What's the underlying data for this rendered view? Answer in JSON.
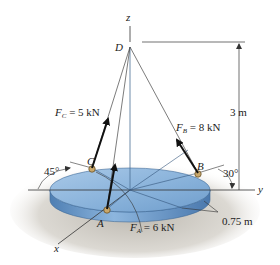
{
  "diagram": {
    "title": "",
    "axes": {
      "x": "x",
      "y": "y",
      "z": "z"
    },
    "points": {
      "D": "D",
      "A": "A",
      "B": "B",
      "C": "C"
    },
    "forces": [
      {
        "id": "FC",
        "symbol": "F",
        "sub": "C",
        "value": " = 5 kN"
      },
      {
        "id": "FB",
        "symbol": "F",
        "sub": "B",
        "value": " = 8 kN"
      },
      {
        "id": "FA",
        "symbol": "F",
        "sub": "A",
        "value": " = 6 kN"
      }
    ],
    "dimensions": {
      "height": "3 m",
      "radius": "0.75 m"
    },
    "angles": {
      "C_angle": "45°",
      "B_angle": "30°"
    },
    "colors": {
      "plate_top": "#8fb6dc",
      "plate_side": "#5f8fc0",
      "shadow": "#d9d6cf",
      "line": "#333333",
      "arrow": "#111111"
    }
  }
}
